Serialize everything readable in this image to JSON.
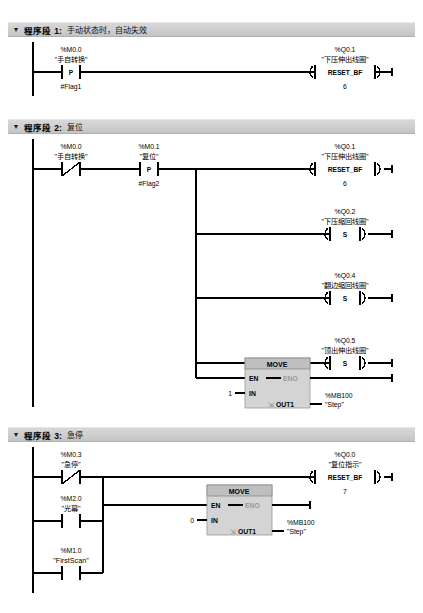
{
  "editor": {
    "language": "LAD",
    "background": "#ffffff",
    "header_bar_color": "#cfcfcf",
    "block_color": "#bfbfbf"
  },
  "networks": [
    {
      "toggle_icon": "triangle-down-icon",
      "title": "程序段 1:",
      "comment": "手动状态时，自动失效",
      "elements": {
        "contact1": {
          "address": "%M0.0",
          "name": "\"手自转换\"",
          "type": "P",
          "flag": "#Flag1"
        },
        "coil1": {
          "address": "%Q0.1",
          "name": "\"下压伸出线圈\"",
          "type": "RESET_BF",
          "count": "6"
        }
      }
    },
    {
      "toggle_icon": "triangle-down-icon",
      "title": "程序段 2:",
      "comment": "复位",
      "elements": {
        "contact1": {
          "address": "%M0.0",
          "name": "\"手自转换\"",
          "type": "NC"
        },
        "contact2": {
          "address": "%M0.1",
          "name": "\"复位\"",
          "type": "P",
          "flag": "#Flag2"
        },
        "coil1": {
          "address": "%Q0.1",
          "name": "\"下压伸出线圈\"",
          "type": "RESET_BF",
          "count": "6"
        },
        "coil2": {
          "address": "%Q0.2",
          "name": "\"下压缩回线圈\"",
          "type": "S"
        },
        "coil3": {
          "address": "%Q0.4",
          "name": "\"翻边缩回线圈\"",
          "type": "S"
        },
        "coil4": {
          "address": "%Q0.5",
          "name": "\"顶出伸出线圈\"",
          "type": "S"
        },
        "move": {
          "title": "MOVE",
          "en": "EN",
          "eno": "ENO",
          "in_label": "IN",
          "in_value": "1",
          "out_label": "OUT1",
          "out_address": "%MB100",
          "out_name": "\"Step\""
        }
      }
    },
    {
      "toggle_icon": "triangle-down-icon",
      "title": "程序段 3:",
      "comment": "急停",
      "elements": {
        "contact1": {
          "address": "%M0.3",
          "name": "\"急停\"",
          "type": "NC"
        },
        "contact2": {
          "address": "%M2.0",
          "name": "\"光幕\"",
          "type": "NO"
        },
        "contact3": {
          "address": "%M1.0",
          "name": "\"FirstScan\"",
          "type": "NO"
        },
        "coil1": {
          "address": "%Q0.0",
          "name": "\"复位指示\"",
          "type": "RESET_BF",
          "count": "7"
        },
        "move": {
          "title": "MOVE",
          "en": "EN",
          "eno": "ENO",
          "in_label": "IN",
          "in_value": "0",
          "out_label": "OUT1",
          "out_address": "%MB100",
          "out_name": "\"Step\""
        }
      }
    }
  ]
}
